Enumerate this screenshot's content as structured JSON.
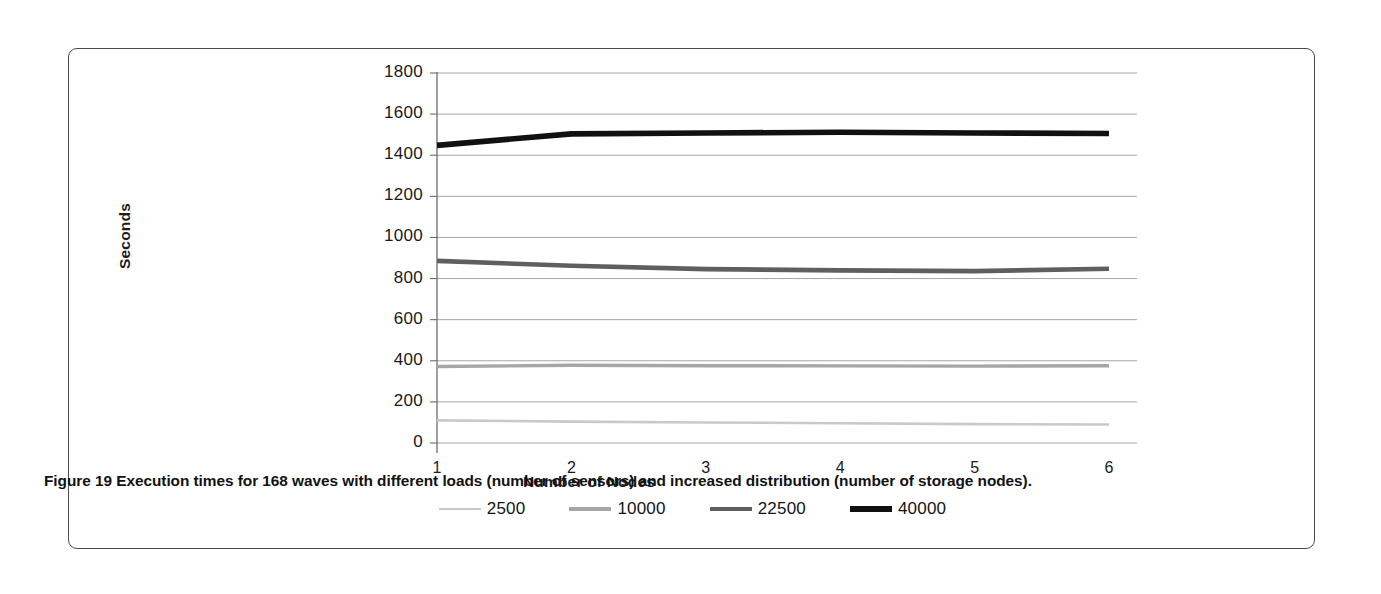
{
  "figure": {
    "caption_prefix": "Figure 19",
    "caption_text": " Execution times for 168 waves with different loads (number of sensors) and increased distribution (number of storage nodes)."
  },
  "chart_data": {
    "type": "line",
    "title": "",
    "xlabel": "Number of Nodes",
    "ylabel": "Seconds",
    "x": [
      1,
      2,
      3,
      4,
      5,
      6
    ],
    "xtick_labels": [
      "1",
      "2",
      "3",
      "4",
      "5",
      "6"
    ],
    "ytick_labels": [
      "0",
      "200",
      "400",
      "600",
      "800",
      "1000",
      "1200",
      "1400",
      "1600",
      "1800"
    ],
    "ylim": [
      0,
      1800
    ],
    "ytick_step": 200,
    "grid": "horizontal",
    "legend_position": "bottom",
    "series": [
      {
        "name": "2500",
        "color": "#c9c9c9",
        "width": 2.6,
        "values": [
          110,
          104,
          100,
          96,
          92,
          90
        ]
      },
      {
        "name": "10000",
        "color": "#a6a6a6",
        "width": 3.4,
        "values": [
          372,
          378,
          376,
          375,
          374,
          376
        ]
      },
      {
        "name": "22500",
        "color": "#5f5f5f",
        "width": 4.6,
        "values": [
          886,
          862,
          846,
          840,
          836,
          848
        ]
      },
      {
        "name": "40000",
        "color": "#111111",
        "width": 5.6,
        "values": [
          1448,
          1504,
          1508,
          1512,
          1508,
          1506
        ]
      }
    ]
  }
}
